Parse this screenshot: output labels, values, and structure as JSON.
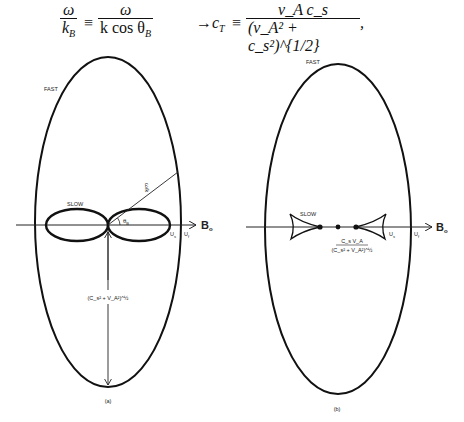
{
  "equation": {
    "lhs_num": "ω",
    "lhs_den": "k",
    "lhs_den_sub": "B",
    "eq1": "≡",
    "mid_num": "ω",
    "mid_den": "k cos θ",
    "mid_den_sub": "B",
    "arrow": "→",
    "cT": "c",
    "cT_sub": "T",
    "eq2": "≡",
    "rhs_num": "v_A c_s",
    "rhs_den": "(v_A² + c_s²)^{1/2}",
    "trailing": ","
  },
  "figure_a": {
    "caption": "(a)",
    "fast_label": "FAST",
    "slow_label": "SLOW",
    "axis_label": "B",
    "axis_label_sub": "o",
    "angle_label": "θ",
    "angle_label_sub": "B",
    "phase_speed_label": "ω/k",
    "us_label": "U",
    "us_sub": "s",
    "uf_label": "U",
    "uf_sub": "f",
    "perp_speed_label": "(C_s² + V_A²)^½"
  },
  "figure_b": {
    "caption": "(b)",
    "fast_label": "FAST",
    "slow_label": "SLOW",
    "axis_label": "B",
    "axis_label_sub": "o",
    "us_label": "U",
    "us_sub": "s",
    "uf_label": "U",
    "uf_sub": "f",
    "cusp_speed_num": "C_s V_A",
    "cusp_speed_den": "(C_s² + V_A²)^½"
  }
}
